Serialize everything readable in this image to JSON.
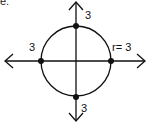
{
  "diagram": {
    "type": "circle-on-axes",
    "corner_label": "e.",
    "circle": {
      "center": [
        0,
        0
      ],
      "radius": 3,
      "radius_label": "r= 3"
    },
    "points": [
      {
        "name": "top",
        "coord": [
          0,
          3
        ],
        "label": "3"
      },
      {
        "name": "bottom",
        "coord": [
          0,
          -3
        ],
        "label": "3"
      },
      {
        "name": "left",
        "coord": [
          -3,
          0
        ],
        "label": "3"
      },
      {
        "name": "right",
        "coord": [
          3,
          0
        ],
        "label": ""
      }
    ],
    "axes": {
      "x_arrows": "both",
      "y_arrows": "both"
    },
    "colors": {
      "stroke": "#111111",
      "background": "#ffffff"
    }
  }
}
